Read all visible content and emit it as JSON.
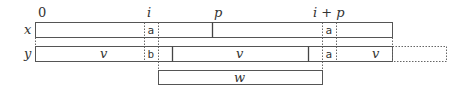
{
  "diagram": {
    "top_labels": {
      "zero": "0",
      "i": "i",
      "p": "p",
      "i_plus_p": "i + p"
    },
    "rows": [
      {
        "name": "x",
        "label": "x",
        "cells": [
          {
            "text": "a",
            "position": "i"
          },
          {
            "text": "a",
            "position": "i + p"
          }
        ]
      },
      {
        "name": "y",
        "label": "y",
        "segments": [
          {
            "text": "v",
            "position": "before i"
          },
          {
            "text": "b",
            "position": "i"
          },
          {
            "text": "v",
            "position": "middle"
          },
          {
            "text": "a",
            "position": "i + p"
          },
          {
            "text": "v",
            "position": "after i + p"
          }
        ]
      }
    ],
    "w_box": {
      "label": "w"
    },
    "colors": {
      "stroke": "#555555",
      "text": "#333333",
      "background": "#ffffff"
    }
  }
}
